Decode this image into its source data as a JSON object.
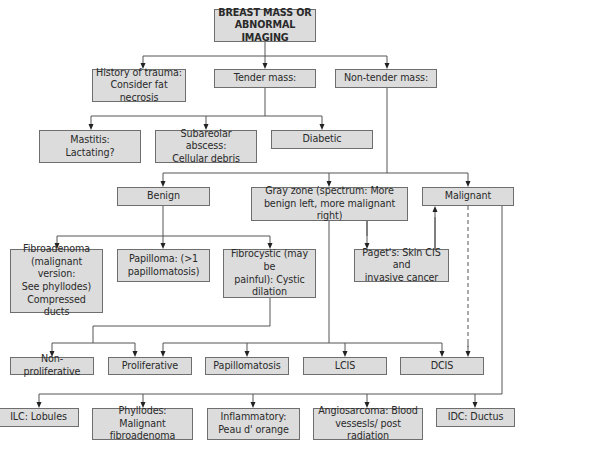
{
  "diagram": {
    "type": "flowchart",
    "colors": {
      "box_fill": "#dcdcdc",
      "box_border": "#6e6e6e",
      "line": "#555555",
      "text": "#2a2a2a",
      "background": "#ffffff"
    },
    "nodes": [
      {
        "id": "root",
        "label": "BREAST MASS OR\nABNORMAL IMAGING",
        "x": 214,
        "y": 9,
        "w": 102,
        "h": 33,
        "bold": true
      },
      {
        "id": "trauma",
        "label": "History of trauma:\nConsider fat necrosis",
        "x": 92,
        "y": 69,
        "w": 94,
        "h": 33
      },
      {
        "id": "tender",
        "label": "Tender mass:",
        "x": 214,
        "y": 69,
        "w": 102,
        "h": 19
      },
      {
        "id": "nontender",
        "label": "Non-tender mass:",
        "x": 335,
        "y": 69,
        "w": 102,
        "h": 19
      },
      {
        "id": "mastitis",
        "label": "Mastitis:\nLactating?",
        "x": 39,
        "y": 130,
        "w": 102,
        "h": 33
      },
      {
        "id": "subareolar",
        "label": "Subareolar abscess:\nCellular debris",
        "x": 155,
        "y": 130,
        "w": 102,
        "h": 33
      },
      {
        "id": "diabetic",
        "label": "Diabetic",
        "x": 271,
        "y": 130,
        "w": 102,
        "h": 19
      },
      {
        "id": "benign",
        "label": "Benign",
        "x": 117,
        "y": 187,
        "w": 93,
        "h": 19
      },
      {
        "id": "grayzone",
        "label": "Gray zone (spectrum: More\nbenign left, more malignant right)",
        "x": 251,
        "y": 187,
        "w": 157,
        "h": 34
      },
      {
        "id": "malignant",
        "label": "Malignant",
        "x": 422,
        "y": 187,
        "w": 92,
        "h": 19
      },
      {
        "id": "fibroadenoma",
        "label": "Fibroadenoma\n(malignant version:\nSee phyllodes)\nCompressed ducts",
        "x": 10,
        "y": 249,
        "w": 93,
        "h": 64
      },
      {
        "id": "papilloma",
        "label": "Papilloma: (>1\npapillomatosis)",
        "x": 117,
        "y": 249,
        "w": 93,
        "h": 33
      },
      {
        "id": "fibrocystic",
        "label": "Fibrocystic (may be\npainful): Cystic\ndilation",
        "x": 223,
        "y": 249,
        "w": 93,
        "h": 49
      },
      {
        "id": "pagets",
        "label": "Paget's: Skin CIS and\ninvasive cancer",
        "x": 354,
        "y": 249,
        "w": 95,
        "h": 33
      },
      {
        "id": "nonprolif",
        "label": "Non-proliferative",
        "x": 10,
        "y": 357,
        "w": 84,
        "h": 18
      },
      {
        "id": "prolif",
        "label": "Proliferative",
        "x": 108,
        "y": 357,
        "w": 84,
        "h": 18
      },
      {
        "id": "papillomatosis",
        "label": "Papillomatosis",
        "x": 205,
        "y": 357,
        "w": 84,
        "h": 18
      },
      {
        "id": "lcis",
        "label": "LCIS",
        "x": 303,
        "y": 357,
        "w": 84,
        "h": 18
      },
      {
        "id": "dcis",
        "label": "DCIS",
        "x": 400,
        "y": 357,
        "w": 84,
        "h": 18
      },
      {
        "id": "ilc",
        "label": "ILC: Lobules",
        "x": -2,
        "y": 408,
        "w": 81,
        "h": 19
      },
      {
        "id": "phyllodes",
        "label": "Phyllodes: Malignant\nfibroadenoma",
        "x": 92,
        "y": 408,
        "w": 101,
        "h": 32
      },
      {
        "id": "inflammatory",
        "label": "Inflammatory:\nPeau d' orange",
        "x": 207,
        "y": 408,
        "w": 93,
        "h": 32
      },
      {
        "id": "angiosarcoma",
        "label": "Angiosarcoma: Blood\nvessesls/ post radiation",
        "x": 313,
        "y": 408,
        "w": 110,
        "h": 32
      },
      {
        "id": "idc",
        "label": "IDC: Ductus",
        "x": 436,
        "y": 408,
        "w": 79,
        "h": 19
      }
    ],
    "edges": [
      {
        "from": "root",
        "to": [
          "trauma",
          "tender",
          "nontender"
        ],
        "path": "M265,42 V56 M143,56 H387",
        "arrows": [
          [
            143,
            56,
            69
          ],
          [
            265,
            56,
            69
          ],
          [
            387,
            56,
            69
          ]
        ]
      },
      {
        "from": "tender",
        "to": [
          "mastitis",
          "subareolar",
          "diabetic"
        ],
        "path": "M265,88 V116 M91,116 H322",
        "arrows": [
          [
            91,
            116,
            130
          ],
          [
            206,
            116,
            130
          ],
          [
            322,
            116,
            130
          ]
        ]
      },
      {
        "from": "nontender",
        "to": [
          "benign",
          "grayzone",
          "malignant"
        ],
        "path": "M387,88 V173 M163,173 H468",
        "arrows": [
          [
            163,
            173,
            187
          ],
          [
            329,
            173,
            187
          ],
          [
            468,
            173,
            187
          ]
        ]
      },
      {
        "from": "benign",
        "to": [
          "fibroadenoma",
          "papilloma",
          "fibrocystic"
        ],
        "path": "M163,206 V236 M57,236 H270",
        "arrows": [
          [
            57,
            236,
            249
          ],
          [
            163,
            236,
            249
          ],
          [
            270,
            236,
            249
          ]
        ]
      },
      {
        "from": "grayzone",
        "to": [
          "pagets"
        ],
        "path": "M367,221 V236",
        "arrows": [
          [
            367,
            221,
            249
          ]
        ]
      },
      {
        "from": "pagets",
        "to": [
          "malignant"
        ],
        "path": "M435,249 V217",
        "arrows_up": [
          [
            435,
            249,
            206
          ]
        ]
      },
      {
        "from": "fibrocystic",
        "to": [
          "nonprolif",
          "prolif"
        ],
        "path": "M270,298 V326 H93 V343 M52,343 H135",
        "arrows": [
          [
            52,
            343,
            357
          ],
          [
            135,
            343,
            357
          ]
        ]
      },
      {
        "from": "grayzone",
        "to": [
          "prolif",
          "papillomatosis",
          "lcis",
          "dcis"
        ],
        "path": "M329,221 V343 M163,343 H442",
        "arrows": [
          [
            163,
            343,
            357
          ],
          [
            247,
            343,
            357
          ],
          [
            345,
            343,
            357
          ],
          [
            442,
            343,
            357
          ]
        ]
      },
      {
        "from": "malignant",
        "to": [
          "dcis"
        ],
        "dashed": true,
        "path": "M468,206 V350",
        "arrows": [
          [
            468,
            343,
            357
          ]
        ]
      },
      {
        "from": "malignant",
        "to": [
          "ilc",
          "phyllodes",
          "inflammatory",
          "angiosarcoma",
          "idc"
        ],
        "path": "M502,206 V394 H39",
        "arrows": [
          [
            39,
            394,
            408
          ],
          [
            143,
            394,
            408
          ],
          [
            253,
            394,
            408
          ],
          [
            367,
            394,
            408
          ],
          [
            475,
            394,
            408
          ]
        ]
      }
    ]
  }
}
